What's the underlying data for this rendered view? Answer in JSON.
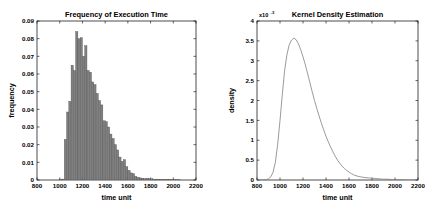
{
  "figure": {
    "background_color": "#ffffff",
    "axis_color": "#000000",
    "panels": [
      "left",
      "right"
    ]
  },
  "chart_data": [
    {
      "type": "bar",
      "panel": "left",
      "title": "Frequency of Execution Time",
      "xlabel": "time unit",
      "ylabel": "frequency",
      "xlim": [
        800,
        2200
      ],
      "ylim": [
        0,
        0.09
      ],
      "xticks": [
        800,
        1000,
        1200,
        1400,
        1600,
        1800,
        2000,
        2200
      ],
      "xtick_labels": [
        "800",
        "1000",
        "1200",
        "1400",
        "1600",
        "1800",
        "2000",
        "2200"
      ],
      "yticks": [
        0,
        0.01,
        0.02,
        0.03,
        0.04,
        0.05,
        0.06,
        0.07,
        0.08,
        0.09
      ],
      "ytick_labels": [
        "0",
        "0.01",
        "0.02",
        "0.03",
        "0.04",
        "0.05",
        "0.06",
        "0.07",
        "0.08",
        "0.09"
      ],
      "grid": false,
      "legend": null,
      "bar_color": "#808080",
      "bar_edge_color": "#4d4d4d",
      "bin_width": 20,
      "bin_starts": [
        1000,
        1020,
        1040,
        1060,
        1080,
        1100,
        1120,
        1140,
        1160,
        1180,
        1200,
        1220,
        1240,
        1260,
        1280,
        1300,
        1320,
        1340,
        1360,
        1380,
        1400,
        1420,
        1440,
        1460,
        1480,
        1500,
        1520,
        1540,
        1560,
        1580,
        1600,
        1620,
        1640,
        1660,
        1680,
        1700,
        1720,
        1740,
        1760,
        1780,
        1800,
        1820,
        1840,
        1860,
        1880,
        1900,
        1920,
        1940,
        1960,
        1980,
        2000,
        2020,
        2040
      ],
      "categories": [
        "1000",
        "1020",
        "1040",
        "1060",
        "1080",
        "1100",
        "1120",
        "1140",
        "1160",
        "1180",
        "1200",
        "1220",
        "1240",
        "1260",
        "1280",
        "1300",
        "1320",
        "1340",
        "1360",
        "1380",
        "1400",
        "1420",
        "1440",
        "1460",
        "1480",
        "1500",
        "1520",
        "1540",
        "1560",
        "1580",
        "1600",
        "1620",
        "1640",
        "1660",
        "1680",
        "1700",
        "1720",
        "1740",
        "1760",
        "1780",
        "1800",
        "1820",
        "1840",
        "1860",
        "1880",
        "1900",
        "1920",
        "1940",
        "1960",
        "1980",
        "2000",
        "2020",
        "2040"
      ],
      "values": [
        0.0005,
        0.0005,
        0.023,
        0.0385,
        0.0445,
        0.065,
        0.062,
        0.084,
        0.08,
        0.0805,
        0.07,
        0.076,
        0.062,
        0.061,
        0.0555,
        0.054,
        0.049,
        0.045,
        0.0425,
        0.0335,
        0.033,
        0.03,
        0.026,
        0.0235,
        0.02,
        0.017,
        0.013,
        0.0105,
        0.0115,
        0.0075,
        0.0055,
        0.004,
        0.0035,
        0.002,
        0.0015,
        0.0012,
        0.001,
        0.0008,
        0.001,
        0.0008,
        0.0007,
        0.0005,
        0.0005,
        0.0004,
        0.0003,
        0.0003,
        0.0002,
        0.0002,
        0.0002,
        0.0001,
        0.0001,
        0.0001,
        0.0001
      ]
    },
    {
      "type": "line",
      "panel": "right",
      "title": "Kernel Density Estimation",
      "xlabel": "time unit",
      "ylabel": "density",
      "y_exponent_label": "x10",
      "y_exponent_power": "-3",
      "xlim": [
        800,
        2200
      ],
      "ylim": [
        0,
        0.004
      ],
      "xticks": [
        800,
        1000,
        1200,
        1400,
        1600,
        1800,
        2000,
        2200
      ],
      "xtick_labels": [
        "800",
        "1000",
        "1200",
        "1400",
        "1600",
        "1800",
        "2000",
        "2200"
      ],
      "yticks": [
        0,
        0.0005,
        0.001,
        0.0015,
        0.002,
        0.0025,
        0.003,
        0.0035,
        0.004
      ],
      "ytick_labels": [
        "0",
        "0.5",
        "1",
        "1.5",
        "2",
        "2.5",
        "3",
        "3.5",
        "4"
      ],
      "grid": false,
      "legend": null,
      "line_color": "#808080",
      "line_width": 0.8,
      "x": [
        800,
        840,
        880,
        900,
        920,
        940,
        960,
        980,
        1000,
        1020,
        1040,
        1060,
        1080,
        1100,
        1120,
        1140,
        1160,
        1180,
        1200,
        1220,
        1240,
        1260,
        1280,
        1300,
        1320,
        1340,
        1360,
        1380,
        1400,
        1420,
        1440,
        1460,
        1480,
        1500,
        1520,
        1540,
        1560,
        1580,
        1600,
        1620,
        1640,
        1660,
        1680,
        1700,
        1740,
        1780,
        1820,
        1860,
        1900,
        1940,
        1980,
        2020,
        2060,
        2100,
        2140,
        2180,
        2200
      ],
      "y": [
        0.0,
        0.0,
        1e-05,
        3e-05,
        8e-05,
        0.0002,
        0.00045,
        0.0009,
        0.0015,
        0.00215,
        0.00275,
        0.00315,
        0.0034,
        0.00352,
        0.00357,
        0.00353,
        0.00343,
        0.00328,
        0.0031,
        0.0029,
        0.00268,
        0.00245,
        0.00222,
        0.002,
        0.0018,
        0.00161,
        0.00143,
        0.00126,
        0.0011,
        0.00096,
        0.00083,
        0.00071,
        0.0006,
        0.0005,
        0.00042,
        0.00035,
        0.00029,
        0.00024,
        0.0002,
        0.00016,
        0.00013,
        0.00011,
        9e-05,
        8e-05,
        6e-05,
        5e-05,
        4e-05,
        3e-05,
        2e-05,
        2e-05,
        1e-05,
        1e-05,
        1e-05,
        0.0,
        0.0,
        0.0,
        0.0
      ]
    }
  ]
}
